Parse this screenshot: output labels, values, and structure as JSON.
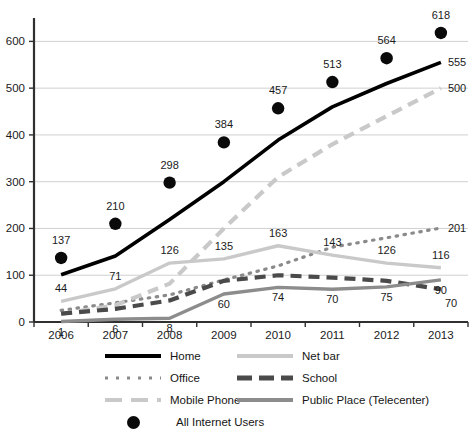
{
  "chart_data": {
    "type": "line",
    "title": "",
    "subtitle": "",
    "xlabel": "",
    "ylabel": "",
    "x": [
      "2006",
      "2007",
      "2008",
      "2009",
      "2010",
      "2011",
      "2012",
      "2013"
    ],
    "categories": [
      "2006",
      "2007",
      "2008",
      "2009",
      "2010",
      "2011",
      "2012",
      "2013"
    ],
    "ylim": [
      0,
      650
    ],
    "yticks": [
      "0",
      "100",
      "200",
      "300",
      "400",
      "500",
      "600"
    ],
    "ytick_values": [
      0,
      100,
      200,
      300,
      400,
      500,
      600
    ],
    "grid": "horizontal",
    "legend_position": "bottom",
    "series": [
      {
        "name": "Home",
        "style": "solid",
        "color": "#000000",
        "values": [
          101,
          141,
          219,
          300,
          389,
          460,
          510,
          555
        ],
        "labels": [
          {
            "x": "2013",
            "value": "555",
            "show": true
          }
        ]
      },
      {
        "name": "Office",
        "style": "dotted",
        "color": "#8a8a8a",
        "values": [
          25,
          41,
          58,
          90,
          120,
          160,
          180,
          201
        ],
        "labels": [
          {
            "x": "2013",
            "value": "201",
            "show": true
          }
        ]
      },
      {
        "name": "Mobile Phone",
        "style": "dashed",
        "color": "#c9c9c9",
        "values": [
          17,
          36,
          82,
          200,
          310,
          380,
          440,
          500
        ],
        "labels": [
          {
            "x": "2013",
            "value": "500",
            "show": true
          }
        ]
      },
      {
        "name": "Net bar",
        "style": "solid",
        "color": "#c9c9c9",
        "values": [
          44,
          71,
          126,
          135,
          163,
          143,
          126,
          116
        ],
        "labels": [
          {
            "x": "2006",
            "value": "44",
            "show": true
          },
          {
            "x": "2007",
            "value": "71",
            "show": true
          },
          {
            "x": "2008",
            "value": "126",
            "show": true
          },
          {
            "x": "2009",
            "value": "135",
            "show": true
          },
          {
            "x": "2010",
            "value": "163",
            "show": true
          },
          {
            "x": "2011",
            "value": "143",
            "show": true
          },
          {
            "x": "2012",
            "value": "126",
            "show": true
          },
          {
            "x": "2013",
            "value": "116",
            "show": true
          }
        ]
      },
      {
        "name": "School",
        "style": "dashed",
        "color": "#4a4a4a",
        "values": [
          18,
          28,
          46,
          88,
          100,
          95,
          88,
          70
        ],
        "labels": [
          {
            "x": "2013",
            "value": "70",
            "show": true
          }
        ]
      },
      {
        "name": "Public Place (Telecenter)",
        "style": "solid",
        "color": "#8c8c8c",
        "values": [
          1,
          6,
          8,
          60,
          74,
          70,
          75,
          90
        ],
        "labels": [
          {
            "x": "2006",
            "value": "1",
            "show": true
          },
          {
            "x": "2007",
            "value": "6",
            "show": true
          },
          {
            "x": "2008",
            "value": "8",
            "show": true
          },
          {
            "x": "2009",
            "value": "60",
            "show": true
          },
          {
            "x": "2010",
            "value": "74",
            "show": true
          },
          {
            "x": "2011",
            "value": "70",
            "show": true
          },
          {
            "x": "2012",
            "value": "75",
            "show": true
          },
          {
            "x": "2013",
            "value": "90",
            "show": true
          }
        ]
      },
      {
        "name": "All Internet Users",
        "style": "markers",
        "color": "#0a0a0a",
        "values": [
          137,
          210,
          298,
          384,
          457,
          513,
          564,
          618
        ],
        "labels": [
          {
            "x": "2006",
            "value": "137",
            "show": true
          },
          {
            "x": "2007",
            "value": "210",
            "show": true
          },
          {
            "x": "2008",
            "value": "298",
            "show": true
          },
          {
            "x": "2009",
            "value": "384",
            "show": true
          },
          {
            "x": "2010",
            "value": "457",
            "show": true
          },
          {
            "x": "2011",
            "value": "513",
            "show": true
          },
          {
            "x": "2012",
            "value": "564",
            "show": true
          },
          {
            "x": "2013",
            "value": "618",
            "show": true
          }
        ]
      }
    ]
  },
  "legend": {
    "items": [
      {
        "label": "Home",
        "swatch": "solid-black-line"
      },
      {
        "label": "Net bar",
        "swatch": "solid-lightgray-line"
      },
      {
        "label": "Office",
        "swatch": "dotted-gray-line"
      },
      {
        "label": "School",
        "swatch": "dashed-darkgray-line"
      },
      {
        "label": "Mobile Phone",
        "swatch": "dashed-lightgray-line"
      },
      {
        "label": "Public Place (Telecenter)",
        "swatch": "solid-gray-line"
      },
      {
        "label": "All Internet Users",
        "swatch": "black-circle-marker"
      }
    ]
  },
  "colors": {
    "home": "#000000",
    "office": "#8a8a8a",
    "mobile_phone": "#c9c9c9",
    "net_bar": "#c9c9c9",
    "school": "#4a4a4a",
    "public_place": "#8c8c8c",
    "all_internet_users": "#0a0a0a",
    "grid": "#d0d0d0",
    "axis": "#303030",
    "background": "#ffffff"
  }
}
